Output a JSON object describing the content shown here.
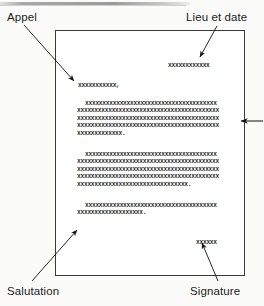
{
  "diagram": {
    "page_label": "letter-page",
    "labels": {
      "appel": "Appel",
      "lieu_et_date": "Lieu et date",
      "salutation": "Salutation",
      "signature": "Signature"
    }
  },
  "letter": {
    "date_line": "xxxxxxxxxxxx",
    "salutation_line": "xxxxxxxxxxx,",
    "paragraphs": [
      {
        "name": "paragraph-1",
        "lines": [
          "xxxxxxxxxxxxxxxxxxxxxxxxxxxxxxxxxxxxxx",
          "xxxxxxxxxxxxxxxxxxxxxxxxxxxxxxxxxxxxxxxxx",
          "xxxxxxxxxxxxxxxxxxxxxxxxxxxxxxxxxxxxxxxxx",
          "xxxxxxxxxxxxxxxxxxxxxxxxxxxxxxxxxxxxxxxxx",
          "xxxxxxxxxxxxx."
        ]
      },
      {
        "name": "paragraph-2",
        "lines": [
          "xxxxxxxxxxxxxxxxxxxxxxxxxxxxxxxxxxxxxx",
          "xxxxxxxxxxxxxxxxxxxxxxxxxxxxxxxxxxxxxxxxx",
          "xxxxxxxxxxxxxxxxxxxxxxxxxxxxxxxxxxxxxxxxx",
          "xxxxxxxxxxxxxxxxxxxxxxxxxxxxxxxxxxxxxxxxx",
          "xxxxxxxxxxxxxxxxxxxxxxxxxxxxxxxx."
        ]
      },
      {
        "name": "paragraph-3",
        "lines": [
          "xxxxxxxxxxxxxxxxxxxxxxxxxxxxxxxxxxxxxx",
          "xxxxxxxxxxxxxxxxxxx."
        ]
      }
    ],
    "signature_line": "xxxxxx"
  },
  "colors": {
    "ink": "#2a2a2a",
    "page_border": "#3a3a3a",
    "page_fill": "#ffffff",
    "canvas": "#fbfbfa",
    "label_text": "#1b1b1b"
  }
}
